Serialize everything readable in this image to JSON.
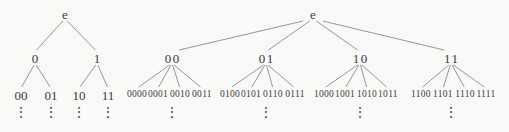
{
  "diagram": {
    "ellipsis_symbol": "⋮",
    "colors": {
      "text": "#3a3a3a",
      "edge": "#8a8a8a",
      "background": "#f9f9f7"
    },
    "trees": [
      {
        "id": "left",
        "nodes": [
          {
            "label": "e",
            "x": 65,
            "y": 14
          },
          {
            "label": "0",
            "x": 35,
            "y": 58
          },
          {
            "label": "1",
            "x": 97,
            "y": 58
          },
          {
            "label": "00",
            "x": 21,
            "y": 95
          },
          {
            "label": "01",
            "x": 51,
            "y": 95
          },
          {
            "label": "10",
            "x": 79,
            "y": 95
          },
          {
            "label": "11",
            "x": 108,
            "y": 95
          }
        ],
        "edges": [
          [
            0,
            1
          ],
          [
            0,
            2
          ],
          [
            1,
            3
          ],
          [
            1,
            4
          ],
          [
            2,
            5
          ],
          [
            2,
            6
          ]
        ],
        "dots": [
          {
            "x": 21,
            "y": 113
          },
          {
            "x": 51,
            "y": 113
          },
          {
            "x": 79,
            "y": 113
          },
          {
            "x": 108,
            "y": 113
          }
        ]
      },
      {
        "id": "right",
        "nodes": [
          {
            "label": "e",
            "x": 313,
            "y": 14
          },
          {
            "label": "00",
            "x": 172,
            "y": 58,
            "spaced": true
          },
          {
            "label": "01",
            "x": 266,
            "y": 58,
            "spaced": true
          },
          {
            "label": "10",
            "x": 360,
            "y": 58,
            "spaced": true
          },
          {
            "label": "11",
            "x": 451,
            "y": 58,
            "spaced": true
          },
          {
            "label": "0000",
            "x": 137,
            "y": 95,
            "small": true
          },
          {
            "label": "0001",
            "x": 158,
            "y": 95,
            "small": true
          },
          {
            "label": "0010",
            "x": 180,
            "y": 95,
            "small": true
          },
          {
            "label": "0011",
            "x": 202,
            "y": 95,
            "small": true
          },
          {
            "label": "0100",
            "x": 230,
            "y": 95,
            "small": true
          },
          {
            "label": "0101",
            "x": 251,
            "y": 95,
            "small": true
          },
          {
            "label": "0110",
            "x": 273,
            "y": 95,
            "small": true
          },
          {
            "label": "0111",
            "x": 295,
            "y": 95,
            "small": true
          },
          {
            "label": "1000",
            "x": 324,
            "y": 95,
            "small": true
          },
          {
            "label": "1001",
            "x": 345,
            "y": 95,
            "small": true
          },
          {
            "label": "1010",
            "x": 367,
            "y": 95,
            "small": true
          },
          {
            "label": "1011",
            "x": 388,
            "y": 95,
            "small": true
          },
          {
            "label": "1100",
            "x": 421,
            "y": 95,
            "small": true
          },
          {
            "label": "1101",
            "x": 443,
            "y": 95,
            "small": true
          },
          {
            "label": "1110",
            "x": 465,
            "y": 95,
            "small": true
          },
          {
            "label": "1111",
            "x": 486,
            "y": 95,
            "small": true
          }
        ],
        "edges": [
          [
            0,
            1
          ],
          [
            0,
            2
          ],
          [
            0,
            3
          ],
          [
            0,
            4
          ],
          [
            1,
            5
          ],
          [
            1,
            6
          ],
          [
            1,
            7
          ],
          [
            1,
            8
          ],
          [
            2,
            9
          ],
          [
            2,
            10
          ],
          [
            2,
            11
          ],
          [
            2,
            12
          ],
          [
            3,
            13
          ],
          [
            3,
            14
          ],
          [
            3,
            15
          ],
          [
            3,
            16
          ],
          [
            4,
            17
          ],
          [
            4,
            18
          ],
          [
            4,
            19
          ],
          [
            4,
            20
          ]
        ],
        "dots": [
          {
            "x": 172,
            "y": 113
          },
          {
            "x": 266,
            "y": 113
          },
          {
            "x": 360,
            "y": 113
          },
          {
            "x": 451,
            "y": 113
          }
        ]
      }
    ]
  }
}
